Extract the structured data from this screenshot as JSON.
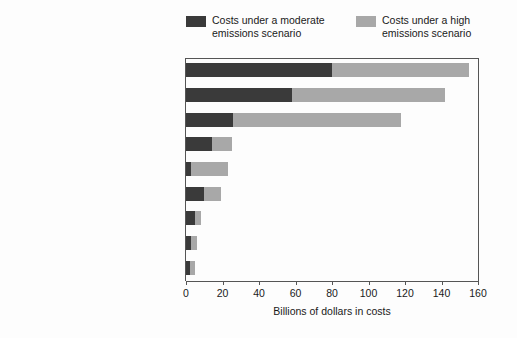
{
  "chart_data": {
    "type": "bar",
    "orientation": "horizontal",
    "stacked": true,
    "title": "",
    "xlabel": "Billions of dollars in costs",
    "ylabel": "",
    "xlim": [
      0,
      160
    ],
    "xticks": [
      0,
      20,
      40,
      60,
      80,
      100,
      120,
      140,
      160
    ],
    "grid": false,
    "legend_position": "top",
    "categories": [
      "Loss of labor",
      "Extreme temperature mortality",
      "Coastal property damage",
      "Road, rail, and bridge damage",
      "Air quality health impacts",
      "Flooding, drainage, water quality",
      "Electricity supply and demand",
      "Coral reefs and fish",
      "Other"
    ],
    "series": [
      {
        "name": "Costs under a moderate emissions scenario",
        "color": "#3a3a3a",
        "values": [
          80,
          58,
          26,
          14,
          3,
          10,
          5,
          3,
          2
        ]
      },
      {
        "name": "Costs under a high emissions scenario",
        "color": "#a8a8a8",
        "values": [
          75,
          84,
          92,
          11,
          20,
          9,
          3,
          3,
          3
        ]
      }
    ],
    "totals": [
      155,
      142,
      118,
      25,
      23,
      19,
      8,
      6,
      5
    ]
  },
  "legend": {
    "entries": [
      {
        "label": "Costs under a moderate emissions scenario",
        "swatch": "moderate"
      },
      {
        "label": "Costs under a high emissions scenario",
        "swatch": "high"
      }
    ]
  },
  "axis": {
    "x_title": "Billions of dollars in costs",
    "x_tick_labels": [
      "0",
      "20",
      "40",
      "60",
      "80",
      "100",
      "120",
      "140",
      "160"
    ]
  },
  "colors": {
    "moderate": "#3a3a3a",
    "high": "#a8a8a8",
    "axis": "#555555",
    "background": "#fdfdfd"
  }
}
